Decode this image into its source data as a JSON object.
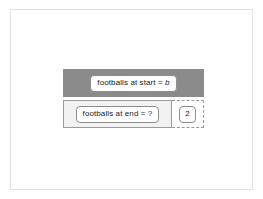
{
  "figure": {
    "type": "bar-model",
    "frame": {
      "border_color": "#e2e2e2",
      "background": "#ffffff"
    },
    "bars": [
      {
        "id": "start",
        "role": "whole",
        "fill_color": "#8b8b8b",
        "style": "solid",
        "label_text": "footballs at start = ",
        "label_variable": "b"
      },
      {
        "id": "end",
        "role": "parts",
        "segments": [
          {
            "id": "end-known",
            "fill_color": "#f2f2f2",
            "style": "solid",
            "label_text": "footballs at end = ?"
          },
          {
            "id": "end-unknown",
            "fill_color": "#ffffff",
            "style": "dashed",
            "value": "2"
          }
        ]
      }
    ]
  },
  "chart_data": {
    "type": "bar",
    "title": "",
    "categories": [
      "footballs at start",
      "footballs at end"
    ],
    "series": [
      {
        "name": "bar-model-rows",
        "values": [
          141,
          141
        ]
      }
    ],
    "annotations": [
      {
        "target": "start",
        "text": "footballs at start = b"
      },
      {
        "target": "end-known",
        "text": "footballs at end = ?"
      },
      {
        "target": "end-unknown",
        "text": "2"
      }
    ],
    "xlabel": "",
    "ylabel": "",
    "grid": false,
    "legend": "none"
  }
}
